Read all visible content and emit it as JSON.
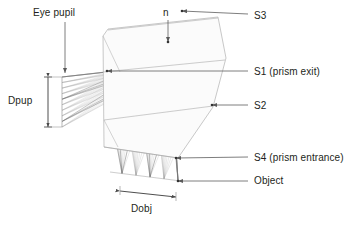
{
  "figure": {
    "background_color": "#ffffff",
    "ray_color": "#8c8c8c",
    "dark_ray_color": "#555555",
    "outline_color": "#b0b0b0",
    "annotation_color": "#231f20",
    "leader_color": "#6f6f6f"
  },
  "labels": {
    "eye_pupil": "Eye pupil",
    "n": "n",
    "dpup": "Dpup",
    "dobj": "Dobj",
    "s3": "S3",
    "s1": "S1 (prism exit)",
    "s2": "S2",
    "s4": "S4 (prism entrance)",
    "object": "Object"
  },
  "annotations": [
    {
      "name": "eye-pupil",
      "text": "Eye pupil",
      "kind": "leader-arrow",
      "direction": "down",
      "from": [
        65,
        22
      ],
      "to": [
        65,
        73
      ]
    },
    {
      "name": "n",
      "text": "n",
      "kind": "leader-arrow",
      "direction": "down",
      "from": [
        168,
        20
      ],
      "to": [
        168,
        42
      ]
    },
    {
      "name": "dpup",
      "text": "Dpup",
      "kind": "dimension-arrow",
      "direction": "vertical",
      "from": [
        48,
        77
      ],
      "to": [
        48,
        127
      ]
    },
    {
      "name": "dobj",
      "text": "Dobj",
      "kind": "dimension-arrow",
      "direction": "horizontal",
      "from": [
        120,
        191
      ],
      "to": [
        176,
        197
      ]
    },
    {
      "name": "s3",
      "text": "S3",
      "kind": "leader-arrow",
      "direction": "left",
      "from": [
        248,
        14
      ],
      "to": [
        182,
        11
      ]
    },
    {
      "name": "s1",
      "text": "S1 (prism exit)",
      "kind": "leader-arrow",
      "direction": "left",
      "from": [
        248,
        71
      ],
      "to": [
        107,
        71
      ]
    },
    {
      "name": "s2",
      "text": "S2",
      "kind": "leader-arrow",
      "direction": "left",
      "from": [
        248,
        105
      ],
      "to": [
        212,
        105
      ]
    },
    {
      "name": "s4",
      "text": "S4 (prism entrance)",
      "kind": "leader-arrow",
      "direction": "left",
      "from": [
        248,
        157
      ],
      "to": [
        176,
        158
      ]
    },
    {
      "name": "object",
      "text": "Object",
      "kind": "leader-arrow",
      "direction": "left",
      "from": [
        248,
        181
      ],
      "to": [
        178,
        181
      ]
    }
  ],
  "chart_data": {
    "type": "scatter",
    "xlabel": "",
    "ylabel": "",
    "surfaces": [
      {
        "name": "S3",
        "label": "S3",
        "p1": [
          108,
          30
        ],
        "p2": [
          218,
          18
        ]
      },
      {
        "name": "S1",
        "label": "S1 (prism exit)",
        "p1": [
          103,
          72
        ],
        "p2": [
          225,
          60
        ]
      },
      {
        "name": "S2",
        "label": "S2",
        "p1": [
          104,
          120
        ],
        "p2": [
          213,
          106
        ]
      },
      {
        "name": "S4",
        "label": "S4 (prism entrance)",
        "p1": [
          104,
          147
        ],
        "p2": [
          178,
          158
        ]
      },
      {
        "name": "Object",
        "label": "Object",
        "p1": [
          110,
          172
        ],
        "p2": [
          181,
          181
        ]
      },
      {
        "name": "EyePupil",
        "label": "Eye pupil",
        "p1": [
          62,
          77
        ],
        "p2": [
          62,
          127
        ]
      }
    ],
    "pupil_rays": 10,
    "object_points": 5,
    "object_point_x": [
      122,
      136,
      150,
      164,
      178
    ],
    "prism_outline": [
      [
        103,
        36
      ],
      [
        108,
        29
      ],
      [
        218,
        17
      ],
      [
        226,
        58
      ],
      [
        213,
        107
      ],
      [
        178,
        158
      ],
      [
        104,
        147
      ]
    ],
    "dimensions": [
      {
        "name": "Dpup",
        "orientation": "vertical",
        "from": [
          48,
          77
        ],
        "to": [
          48,
          127
        ]
      },
      {
        "name": "Dobj",
        "orientation": "horizontal",
        "from": [
          120,
          191
        ],
        "to": [
          176,
          197
        ]
      }
    ]
  }
}
